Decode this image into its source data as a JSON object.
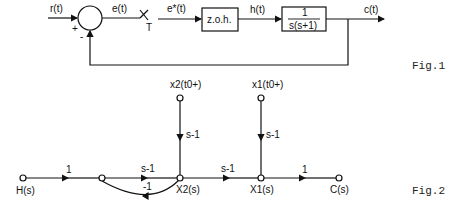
{
  "fig1": {
    "caption": "Fig.1",
    "signals": {
      "input": "r(t)",
      "error": "e(t)",
      "sampled": "e*(t)",
      "hold_out": "h(t)",
      "output": "c(t)"
    },
    "sum_signs": {
      "plus": "+",
      "minus": "-"
    },
    "sampler_label": "T",
    "blocks": {
      "zoh": "z.o.h.",
      "plant_num": "1",
      "plant_den": "s(s+1)"
    }
  },
  "fig2": {
    "caption": "Fig.2",
    "nodes": {
      "input": "H(s)",
      "x2": "X2(s)",
      "x1": "X1(s)",
      "output": "C(s)",
      "x2_init": "x2(t0+)",
      "x1_init": "x1(t0+)"
    },
    "gains": {
      "h_to_n": "1",
      "n_to_x2": "s-1",
      "x2_to_n": "-1",
      "x2_to_x1": "s-1",
      "x1_to_c": "1",
      "x2init_to_x2": "s-1",
      "x1init_to_x1": "s-1"
    }
  }
}
